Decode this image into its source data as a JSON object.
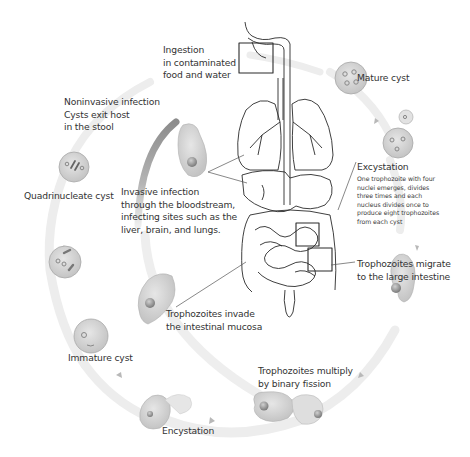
{
  "diagram": {
    "type": "life-cycle",
    "colors": {
      "background": "#ffffff",
      "cycle_path": "#ececec",
      "invasive_path": "#9a9a9a",
      "cell_fill": "#d6d6d6",
      "cell_stroke": "#a8a8a8",
      "anatomy_stroke": "#2a2a2a",
      "text": "#333333",
      "text_secondary": "#9a9a9a"
    },
    "labels": {
      "ingestion": {
        "line1": "Ingestion",
        "line2": "in contaminated",
        "line3": "food and water"
      },
      "mature_cyst": "Mature cyst",
      "excystation": {
        "title": "Excystation",
        "line1": "One trophozoite with four",
        "line2": "nuclei emerges, divides",
        "line3": "three times and each",
        "line4": "nucleus divides once to",
        "line5": "produce eight trophozoites",
        "line6": "from each cyst"
      },
      "migrate": {
        "line1": "Trophozoites  migrate",
        "line2": "to the large intestine"
      },
      "multiply": {
        "line1": "Trophozoites multiply",
        "line2": "by binary fission"
      },
      "encystation": "Encystation",
      "immature_cyst": "Immature cyst",
      "quadrinucleate_cyst": "Quadrinucleate cyst",
      "noninvasive": {
        "title": "Noninvasive infection",
        "line1": "Cysts exit host",
        "line2": "in the stool"
      },
      "invasive": {
        "title": "Invasive infection",
        "line1": "through the bloodstream,",
        "line2": "infecting sites such as the",
        "line3": "liver, brain, and lungs."
      },
      "invade_mucosa": {
        "line1": "Trophozoites invade",
        "line2": "the intestinal mucosa"
      }
    },
    "stages": [
      "Ingestion in contaminated food and water",
      "Mature cyst",
      "Excystation",
      "Trophozoites migrate to the large intestine",
      "Trophozoites multiply by binary fission",
      "Encystation",
      "Immature cyst",
      "Quadrinucleate cyst",
      "Noninvasive infection: Cysts exit host in the stool",
      "Invasive infection through the bloodstream",
      "Trophozoites invade the intestinal mucosa"
    ]
  }
}
